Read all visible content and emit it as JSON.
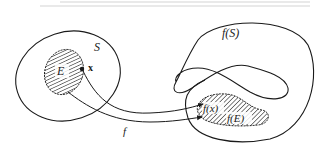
{
  "figure": {
    "domain_set": {
      "label": "S"
    },
    "subset": {
      "label": "E"
    },
    "point": {
      "label": "x"
    },
    "mapping": {
      "label": "f"
    },
    "image_set": {
      "label": "f(S)"
    },
    "image_point": {
      "label": "f(x)"
    },
    "image_subset": {
      "label": "f(E)"
    },
    "colors": {
      "stroke": "#1a1a1a",
      "hatch": "#2a2a2a",
      "background": "#ffffff"
    }
  }
}
